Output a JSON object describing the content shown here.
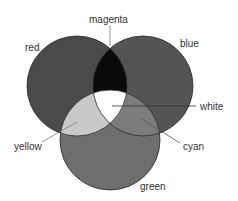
{
  "diagram": {
    "type": "venn",
    "title": "",
    "circles": [
      {
        "name": "red",
        "label": "red",
        "fill": "#4a4a4a"
      },
      {
        "name": "blue",
        "label": "blue",
        "fill": "#545454"
      },
      {
        "name": "green",
        "label": "green",
        "fill": "#6e6e6e"
      }
    ],
    "overlaps": [
      {
        "name": "magenta",
        "label": "magenta",
        "sets": [
          "red",
          "blue"
        ],
        "fill": "#0a0a0a"
      },
      {
        "name": "yellow",
        "label": "yellow",
        "sets": [
          "red",
          "green"
        ],
        "fill": "#c9c9c9"
      },
      {
        "name": "cyan",
        "label": "cyan",
        "sets": [
          "blue",
          "green"
        ],
        "fill": "#7c7c7c"
      },
      {
        "name": "white",
        "label": "white",
        "sets": [
          "red",
          "blue",
          "green"
        ],
        "fill": "#ffffff"
      }
    ]
  }
}
